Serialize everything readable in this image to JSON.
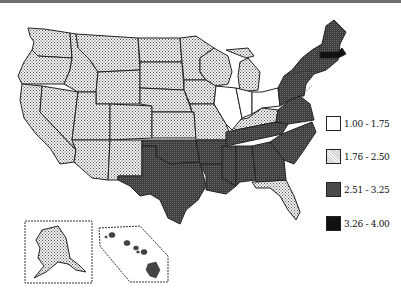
{
  "map": {
    "type": "choropleth",
    "region": "United States",
    "legend": [
      {
        "label": "1.00 - 1.75",
        "fill": "white"
      },
      {
        "label": "1.76 - 2.50",
        "fill": "light-dotted"
      },
      {
        "label": "2.51 - 3.25",
        "fill": "dark-gray"
      },
      {
        "label": "3.26 - 4.00",
        "fill": "black"
      }
    ],
    "colors": {
      "white": "#ffffff",
      "light": "#d8d8d8",
      "dark": "#4a4a4a",
      "black": "#111111",
      "border": "#222222"
    },
    "regions": {
      "white": [
        "Illinois",
        "Indiana",
        "Ohio"
      ],
      "light": [
        "Washington",
        "Oregon",
        "California",
        "Nevada",
        "Idaho",
        "Montana",
        "Wyoming",
        "Utah",
        "Arizona",
        "Colorado",
        "New Mexico",
        "North Dakota",
        "South Dakota",
        "Nebraska",
        "Kansas",
        "Minnesota",
        "Iowa",
        "Missouri",
        "Wisconsin",
        "Michigan",
        "Kentucky",
        "Florida",
        "Alaska"
      ],
      "dark": [
        "Oklahoma",
        "Texas",
        "Arkansas",
        "Louisiana",
        "Mississippi",
        "Alabama",
        "Tennessee",
        "Georgia",
        "South Carolina",
        "North Carolina",
        "Virginia",
        "West Virginia",
        "Pennsylvania",
        "New York",
        "Maryland",
        "Delaware",
        "New Jersey",
        "Connecticut",
        "Rhode Island",
        "Vermont",
        "New Hampshire",
        "Maine",
        "Hawaii"
      ],
      "black": [
        "Massachusetts"
      ]
    }
  }
}
